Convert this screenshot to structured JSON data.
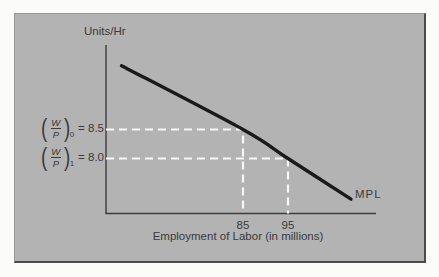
{
  "figure": {
    "y_axis_label": "Units/Hr",
    "x_axis_label": "Employment of Labor (in millions)",
    "curve_label": "MPL"
  },
  "wage_labels": [
    {
      "open": "(",
      "numerator": "W",
      "denominator": "P",
      "close": ")",
      "subscript": "0",
      "equals_value": "= 8.5"
    },
    {
      "open": "(",
      "numerator": "W",
      "denominator": "P",
      "close": ")",
      "subscript": "1",
      "equals_value": "= 8.0"
    }
  ],
  "colors": {
    "page_bg": "#fbfbfa",
    "panel_bg": "#b3b3b3",
    "frame_dark": "#4c4c4c",
    "frame_light": "#979797",
    "text": "#3a3a3a",
    "curve": "#1a1a1a",
    "dashed": "#f7f7f7",
    "axis": "#3c3c3c"
  },
  "chart_data": {
    "type": "line",
    "title": "",
    "xlabel": "Employment of Labor (in millions)",
    "ylabel": "Units/Hr",
    "x_ticks": [
      85,
      95
    ],
    "xlim": [
      55,
      115
    ],
    "ylim": [
      6.9,
      10.0
    ],
    "grid": false,
    "legend": false,
    "series": [
      {
        "name": "MPL",
        "points": [
          [
            58,
            9.6
          ],
          [
            85,
            8.5
          ],
          [
            95,
            8.0
          ],
          [
            109,
            7.3
          ]
        ]
      }
    ],
    "reference_lines": [
      {
        "label": "(W/P)0 = 8.5",
        "x": 85,
        "y": 8.5
      },
      {
        "label": "(W/P)1 = 8.0",
        "x": 95,
        "y": 8.0
      }
    ]
  }
}
